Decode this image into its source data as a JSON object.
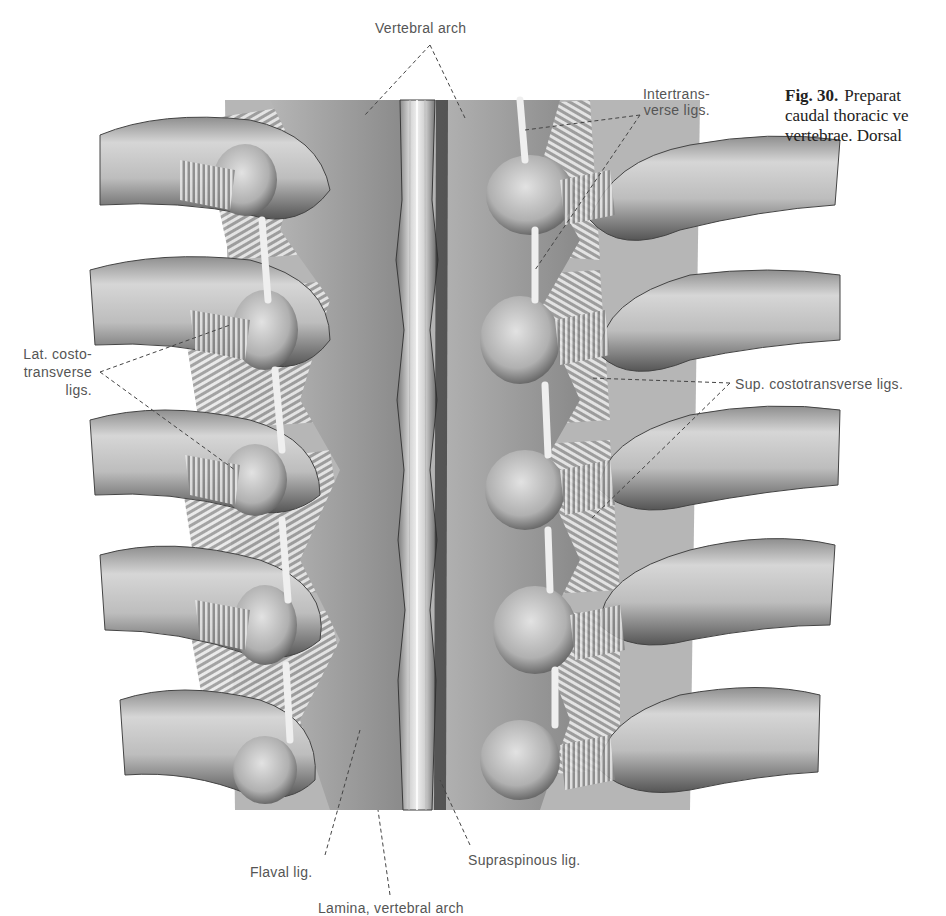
{
  "figure": {
    "number": "Fig. 30.",
    "caption_lines": [
      "Preparat",
      "caudal thoracic ve",
      "vertebrae. Dorsal"
    ]
  },
  "labels": {
    "vertebral_arch": "Vertebral arch",
    "intertransverse_line1": "Intertrans-",
    "intertransverse_line2": "verse ligs.",
    "lat_costo_line1": "Lat. costo-",
    "lat_costo_line2": "transverse",
    "lat_costo_line3": "ligs.",
    "sup_costotransverse": "Sup. costotransverse ligs.",
    "flaval": "Flaval lig.",
    "supraspinous": "Supraspinous lig.",
    "lamina": "Lamina, vertebral arch"
  },
  "colors": {
    "background": "#ffffff",
    "label_text": "#555555",
    "caption_text": "#222222",
    "bone_light": "#d9d9d9",
    "bone_mid": "#a8a8a8",
    "bone_dark": "#555555",
    "leader_line": "#444444"
  }
}
